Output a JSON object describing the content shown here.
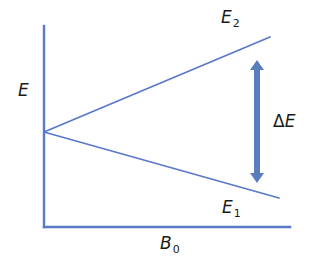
{
  "diagram": {
    "colors": {
      "line": "#5b79c9",
      "arrow": "#5a7dbf",
      "text": "#1a1a1a",
      "background": "#ffffff"
    },
    "labels": {
      "y_axis": {
        "main": "E",
        "sub": ""
      },
      "x_axis": {
        "main": "B",
        "sub": "0"
      },
      "upper_level": {
        "main": "E",
        "sub": "2"
      },
      "lower_level": {
        "main": "E",
        "sub": "1"
      },
      "gap": {
        "delta": "Δ",
        "main": "E"
      }
    },
    "geometry": {
      "origin_vertex": [
        44,
        132
      ],
      "y_axis": {
        "x": 44,
        "y_top": 26,
        "y_bottom": 227
      },
      "x_axis": {
        "y": 227,
        "x_left": 44,
        "x_right": 290
      },
      "upper_line_end": [
        270,
        37
      ],
      "lower_line_end": [
        279,
        198
      ],
      "arrow": {
        "x": 257,
        "y_top": 60,
        "y_bottom": 183
      }
    }
  }
}
